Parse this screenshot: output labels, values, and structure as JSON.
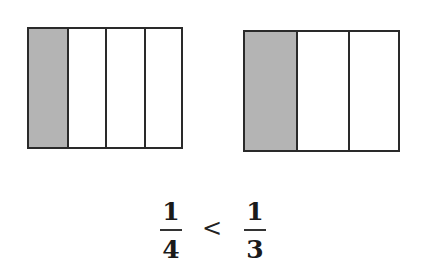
{
  "diagram": {
    "left_model": {
      "parts": 4,
      "shaded": 1,
      "shade_color": "#b4b4b4"
    },
    "right_model": {
      "parts": 3,
      "shaded": 1,
      "shade_color": "#b4b4b4"
    },
    "comparison": {
      "left_fraction": {
        "numerator": "1",
        "denominator": "4"
      },
      "operator": "<",
      "right_fraction": {
        "numerator": "1",
        "denominator": "3"
      }
    }
  }
}
